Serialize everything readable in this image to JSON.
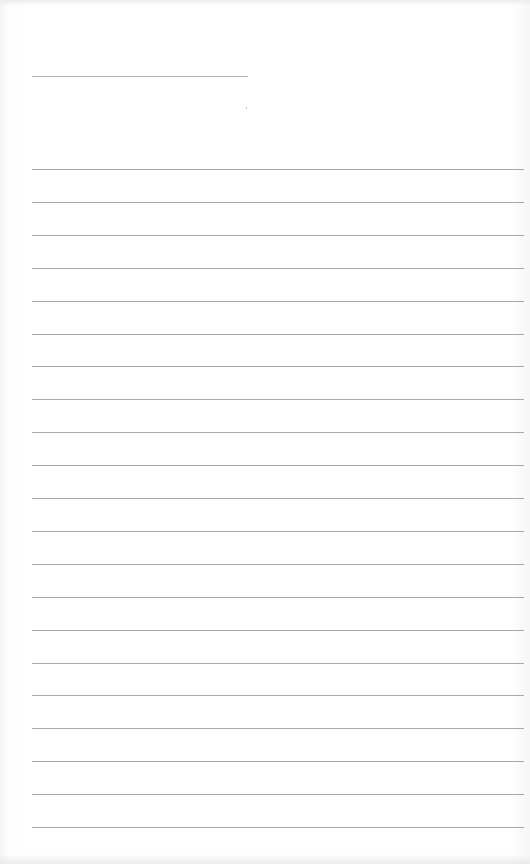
{
  "page": {
    "type": "lined-paper",
    "background_color": "#ffffff",
    "line_color": "#a8a8a8",
    "title_line": {
      "x": 32,
      "y": 76,
      "width": 216
    },
    "ruled_lines": {
      "count": 21,
      "start_y": 169,
      "spacing": 32.9,
      "x": 32,
      "width": 492
    }
  }
}
